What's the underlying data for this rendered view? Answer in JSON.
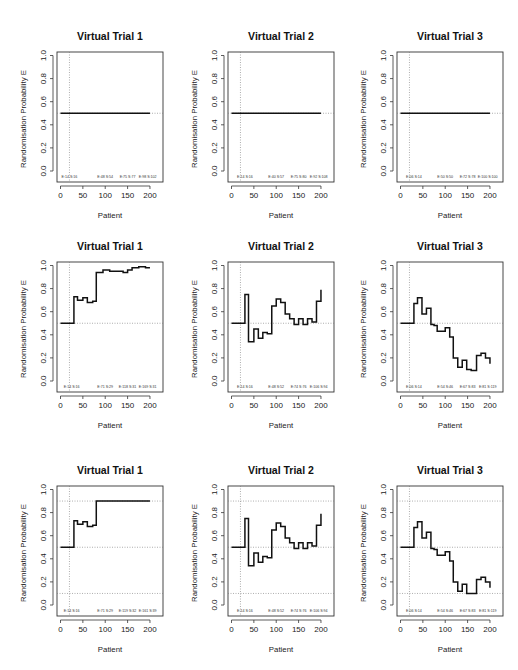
{
  "figure": {
    "rows": 3,
    "cols": 3,
    "panel_titles": [
      "Virtual Trial 1",
      "Virtual Trial 2",
      "Virtual Trial 3"
    ],
    "xlabel": "Patient",
    "ylabel": "Randomisation Probability E"
  },
  "chart_data": [
    {
      "type": "line",
      "row": 0,
      "col": 0,
      "title": "Virtual Trial 1",
      "xlabel": "Patient",
      "ylabel": "Randomisation Probability E",
      "xlim": [
        0,
        200
      ],
      "ylim": [
        0,
        1
      ],
      "xticks": [
        0,
        50,
        100,
        150,
        200
      ],
      "yticks": [
        0.0,
        0.2,
        0.4,
        0.6,
        0.8,
        1.0
      ],
      "vline": 20,
      "hlines": [
        0.5
      ],
      "annotations": [
        {
          "x": 20,
          "text": "E:14 S:16"
        },
        {
          "x": 100,
          "text": "E:48 S:54"
        },
        {
          "x": 150,
          "text": "E:75 S:77"
        },
        {
          "x": 195,
          "text": "E:98 S:102"
        }
      ],
      "steps": [
        [
          0,
          0.5
        ],
        [
          200,
          0.5
        ]
      ]
    },
    {
      "type": "line",
      "row": 0,
      "col": 1,
      "title": "Virtual Trial 2",
      "xlabel": "Patient",
      "ylabel": "Randomisation Probability E",
      "xlim": [
        0,
        200
      ],
      "ylim": [
        0,
        1
      ],
      "xticks": [
        0,
        50,
        100,
        150,
        200
      ],
      "yticks": [
        0.0,
        0.2,
        0.4,
        0.6,
        0.8,
        1.0
      ],
      "vline": 20,
      "hlines": [
        0.5
      ],
      "annotations": [
        {
          "x": 30,
          "text": "E:14 S:16"
        },
        {
          "x": 100,
          "text": "E:40 S:57"
        },
        {
          "x": 150,
          "text": "E:75 S:80"
        },
        {
          "x": 195,
          "text": "E:92 S:108"
        }
      ],
      "steps": [
        [
          0,
          0.5
        ],
        [
          200,
          0.5
        ]
      ]
    },
    {
      "type": "line",
      "row": 0,
      "col": 2,
      "title": "Virtual Trial 3",
      "xlabel": "Patient",
      "ylabel": "Randomisation Probability E",
      "xlim": [
        0,
        200
      ],
      "ylim": [
        0,
        1
      ],
      "xticks": [
        0,
        50,
        100,
        150,
        200
      ],
      "yticks": [
        0.0,
        0.2,
        0.4,
        0.6,
        0.8,
        1.0
      ],
      "vline": 20,
      "hlines": [
        0.5
      ],
      "annotations": [
        {
          "x": 30,
          "text": "E:06 S:14"
        },
        {
          "x": 100,
          "text": "E:50 S:50"
        },
        {
          "x": 150,
          "text": "E:72 S:78"
        },
        {
          "x": 195,
          "text": "E:100 S:100"
        }
      ],
      "steps": [
        [
          0,
          0.5
        ],
        [
          200,
          0.5
        ]
      ]
    },
    {
      "type": "line",
      "row": 1,
      "col": 0,
      "title": "Virtual Trial 1",
      "xlabel": "Patient",
      "ylabel": "Randomisation Probability E",
      "xlim": [
        0,
        200
      ],
      "ylim": [
        0,
        1
      ],
      "xticks": [
        0,
        50,
        100,
        150,
        200
      ],
      "yticks": [
        0.0,
        0.2,
        0.4,
        0.6,
        0.8,
        1.0
      ],
      "vline": 20,
      "hlines": [
        0.5
      ],
      "annotations": [
        {
          "x": 25,
          "text": "E:14 S:16"
        },
        {
          "x": 100,
          "text": "E:71 S:29"
        },
        {
          "x": 150,
          "text": "E:118 S:31"
        },
        {
          "x": 195,
          "text": "E:169 S:31"
        }
      ],
      "steps": [
        [
          0,
          0.5
        ],
        [
          30,
          0.5
        ],
        [
          30,
          0.73
        ],
        [
          38,
          0.73
        ],
        [
          38,
          0.7
        ],
        [
          50,
          0.7
        ],
        [
          50,
          0.72
        ],
        [
          60,
          0.72
        ],
        [
          60,
          0.68
        ],
        [
          72,
          0.68
        ],
        [
          72,
          0.69
        ],
        [
          80,
          0.69
        ],
        [
          80,
          0.94
        ],
        [
          95,
          0.94
        ],
        [
          95,
          0.96
        ],
        [
          110,
          0.96
        ],
        [
          110,
          0.95
        ],
        [
          140,
          0.95
        ],
        [
          140,
          0.94
        ],
        [
          150,
          0.94
        ],
        [
          150,
          0.96
        ],
        [
          160,
          0.96
        ],
        [
          160,
          0.98
        ],
        [
          175,
          0.98
        ],
        [
          175,
          0.99
        ],
        [
          190,
          0.99
        ],
        [
          190,
          0.98
        ],
        [
          200,
          0.98
        ]
      ]
    },
    {
      "type": "line",
      "row": 1,
      "col": 1,
      "title": "Virtual Trial 2",
      "xlabel": "Patient",
      "ylabel": "Randomisation Probability E",
      "xlim": [
        0,
        200
      ],
      "ylim": [
        0,
        1
      ],
      "xticks": [
        0,
        50,
        100,
        150,
        200
      ],
      "yticks": [
        0.0,
        0.2,
        0.4,
        0.6,
        0.8,
        1.0
      ],
      "vline": 20,
      "hlines": [
        0.5
      ],
      "annotations": [
        {
          "x": 30,
          "text": "E:14 S:16"
        },
        {
          "x": 100,
          "text": "E:48 S:52"
        },
        {
          "x": 150,
          "text": "E:74 S:76"
        },
        {
          "x": 195,
          "text": "E:106 S:94"
        }
      ],
      "steps": [
        [
          0,
          0.5
        ],
        [
          30,
          0.5
        ],
        [
          30,
          0.75
        ],
        [
          38,
          0.75
        ],
        [
          38,
          0.34
        ],
        [
          50,
          0.34
        ],
        [
          50,
          0.45
        ],
        [
          60,
          0.45
        ],
        [
          60,
          0.37
        ],
        [
          70,
          0.37
        ],
        [
          70,
          0.42
        ],
        [
          80,
          0.42
        ],
        [
          80,
          0.41
        ],
        [
          90,
          0.41
        ],
        [
          90,
          0.65
        ],
        [
          100,
          0.65
        ],
        [
          100,
          0.71
        ],
        [
          110,
          0.71
        ],
        [
          110,
          0.68
        ],
        [
          120,
          0.68
        ],
        [
          120,
          0.58
        ],
        [
          130,
          0.58
        ],
        [
          130,
          0.54
        ],
        [
          140,
          0.54
        ],
        [
          140,
          0.49
        ],
        [
          150,
          0.49
        ],
        [
          150,
          0.54
        ],
        [
          160,
          0.54
        ],
        [
          160,
          0.49
        ],
        [
          170,
          0.49
        ],
        [
          170,
          0.54
        ],
        [
          180,
          0.54
        ],
        [
          180,
          0.51
        ],
        [
          190,
          0.51
        ],
        [
          190,
          0.69
        ],
        [
          200,
          0.69
        ],
        [
          200,
          0.79
        ]
      ]
    },
    {
      "type": "line",
      "row": 1,
      "col": 2,
      "title": "Virtual Trial 3",
      "xlabel": "Patient",
      "ylabel": "Randomisation Probability E",
      "xlim": [
        0,
        200
      ],
      "ylim": [
        0,
        1
      ],
      "xticks": [
        0,
        50,
        100,
        150,
        200
      ],
      "yticks": [
        0.0,
        0.2,
        0.4,
        0.6,
        0.8,
        1.0
      ],
      "vline": 20,
      "hlines": [
        0.5
      ],
      "annotations": [
        {
          "x": 30,
          "text": "E:06 S:14"
        },
        {
          "x": 100,
          "text": "E:54 S:46"
        },
        {
          "x": 150,
          "text": "E:67 S:83"
        },
        {
          "x": 195,
          "text": "E:81 S:119"
        }
      ],
      "steps": [
        [
          0,
          0.5
        ],
        [
          30,
          0.5
        ],
        [
          30,
          0.67
        ],
        [
          38,
          0.67
        ],
        [
          38,
          0.72
        ],
        [
          48,
          0.72
        ],
        [
          48,
          0.58
        ],
        [
          58,
          0.58
        ],
        [
          58,
          0.63
        ],
        [
          68,
          0.63
        ],
        [
          68,
          0.49
        ],
        [
          75,
          0.49
        ],
        [
          75,
          0.48
        ],
        [
          82,
          0.48
        ],
        [
          82,
          0.43
        ],
        [
          100,
          0.43
        ],
        [
          100,
          0.46
        ],
        [
          110,
          0.46
        ],
        [
          110,
          0.38
        ],
        [
          118,
          0.38
        ],
        [
          118,
          0.2
        ],
        [
          128,
          0.2
        ],
        [
          128,
          0.12
        ],
        [
          138,
          0.12
        ],
        [
          138,
          0.18
        ],
        [
          148,
          0.18
        ],
        [
          148,
          0.1
        ],
        [
          158,
          0.1
        ],
        [
          158,
          0.09
        ],
        [
          170,
          0.09
        ],
        [
          170,
          0.22
        ],
        [
          180,
          0.22
        ],
        [
          180,
          0.24
        ],
        [
          190,
          0.24
        ],
        [
          190,
          0.2
        ],
        [
          200,
          0.2
        ],
        [
          200,
          0.15
        ]
      ]
    },
    {
      "type": "line",
      "row": 2,
      "col": 0,
      "title": "Virtual Trial 1",
      "xlabel": "Patient",
      "ylabel": "Randomisation Probability E",
      "xlim": [
        0,
        200
      ],
      "ylim": [
        0,
        1
      ],
      "xticks": [
        0,
        50,
        100,
        150,
        200
      ],
      "yticks": [
        0.0,
        0.2,
        0.4,
        0.6,
        0.8,
        1.0
      ],
      "vline": 20,
      "hlines": [
        0.1,
        0.5,
        0.9
      ],
      "annotations": [
        {
          "x": 25,
          "text": "E:14 S:16"
        },
        {
          "x": 100,
          "text": "E:71 S:29"
        },
        {
          "x": 150,
          "text": "E:119 S:32"
        },
        {
          "x": 195,
          "text": "E:161 S:39"
        }
      ],
      "steps": [
        [
          0,
          0.5
        ],
        [
          30,
          0.5
        ],
        [
          30,
          0.73
        ],
        [
          38,
          0.73
        ],
        [
          38,
          0.7
        ],
        [
          50,
          0.7
        ],
        [
          50,
          0.72
        ],
        [
          60,
          0.72
        ],
        [
          60,
          0.68
        ],
        [
          72,
          0.68
        ],
        [
          72,
          0.69
        ],
        [
          80,
          0.69
        ],
        [
          80,
          0.9
        ],
        [
          200,
          0.9
        ]
      ]
    },
    {
      "type": "line",
      "row": 2,
      "col": 1,
      "title": "Virtual Trial 2",
      "xlabel": "Patient",
      "ylabel": "Randomisation Probability E",
      "xlim": [
        0,
        200
      ],
      "ylim": [
        0,
        1
      ],
      "xticks": [
        0,
        50,
        100,
        150,
        200
      ],
      "yticks": [
        0.0,
        0.2,
        0.4,
        0.6,
        0.8,
        1.0
      ],
      "vline": 20,
      "hlines": [
        0.1,
        0.5,
        0.9
      ],
      "annotations": [
        {
          "x": 30,
          "text": "E:14 S:16"
        },
        {
          "x": 100,
          "text": "E:48 S:52"
        },
        {
          "x": 150,
          "text": "E:74 S:76"
        },
        {
          "x": 195,
          "text": "E:106 S:94"
        }
      ],
      "steps": [
        [
          0,
          0.5
        ],
        [
          30,
          0.5
        ],
        [
          30,
          0.75
        ],
        [
          38,
          0.75
        ],
        [
          38,
          0.34
        ],
        [
          50,
          0.34
        ],
        [
          50,
          0.45
        ],
        [
          60,
          0.45
        ],
        [
          60,
          0.37
        ],
        [
          70,
          0.37
        ],
        [
          70,
          0.42
        ],
        [
          80,
          0.42
        ],
        [
          80,
          0.41
        ],
        [
          90,
          0.41
        ],
        [
          90,
          0.65
        ],
        [
          100,
          0.65
        ],
        [
          100,
          0.71
        ],
        [
          110,
          0.71
        ],
        [
          110,
          0.68
        ],
        [
          120,
          0.68
        ],
        [
          120,
          0.58
        ],
        [
          130,
          0.58
        ],
        [
          130,
          0.54
        ],
        [
          140,
          0.54
        ],
        [
          140,
          0.49
        ],
        [
          150,
          0.49
        ],
        [
          150,
          0.54
        ],
        [
          160,
          0.54
        ],
        [
          160,
          0.49
        ],
        [
          170,
          0.49
        ],
        [
          170,
          0.54
        ],
        [
          180,
          0.54
        ],
        [
          180,
          0.51
        ],
        [
          190,
          0.51
        ],
        [
          190,
          0.69
        ],
        [
          200,
          0.69
        ],
        [
          200,
          0.79
        ]
      ]
    },
    {
      "type": "line",
      "row": 2,
      "col": 2,
      "title": "Virtual Trial 3",
      "xlabel": "Patient",
      "ylabel": "Randomisation Probability E",
      "xlim": [
        0,
        200
      ],
      "ylim": [
        0,
        1
      ],
      "xticks": [
        0,
        50,
        100,
        150,
        200
      ],
      "yticks": [
        0.0,
        0.2,
        0.4,
        0.6,
        0.8,
        1.0
      ],
      "vline": 20,
      "hlines": [
        0.1,
        0.5,
        0.9
      ],
      "annotations": [
        {
          "x": 30,
          "text": "E:06 S:14"
        },
        {
          "x": 100,
          "text": "E:54 S:46"
        },
        {
          "x": 150,
          "text": "E:67 S:83"
        },
        {
          "x": 195,
          "text": "E:81 S:119"
        }
      ],
      "steps": [
        [
          0,
          0.5
        ],
        [
          30,
          0.5
        ],
        [
          30,
          0.67
        ],
        [
          38,
          0.67
        ],
        [
          38,
          0.72
        ],
        [
          48,
          0.72
        ],
        [
          48,
          0.58
        ],
        [
          58,
          0.58
        ],
        [
          58,
          0.63
        ],
        [
          68,
          0.63
        ],
        [
          68,
          0.49
        ],
        [
          75,
          0.49
        ],
        [
          75,
          0.48
        ],
        [
          82,
          0.48
        ],
        [
          82,
          0.43
        ],
        [
          100,
          0.43
        ],
        [
          100,
          0.46
        ],
        [
          110,
          0.46
        ],
        [
          110,
          0.38
        ],
        [
          118,
          0.38
        ],
        [
          118,
          0.2
        ],
        [
          128,
          0.2
        ],
        [
          128,
          0.12
        ],
        [
          138,
          0.12
        ],
        [
          138,
          0.18
        ],
        [
          148,
          0.18
        ],
        [
          148,
          0.1
        ],
        [
          170,
          0.1
        ],
        [
          170,
          0.22
        ],
        [
          180,
          0.22
        ],
        [
          180,
          0.24
        ],
        [
          190,
          0.24
        ],
        [
          190,
          0.2
        ],
        [
          200,
          0.2
        ],
        [
          200,
          0.15
        ]
      ]
    }
  ]
}
